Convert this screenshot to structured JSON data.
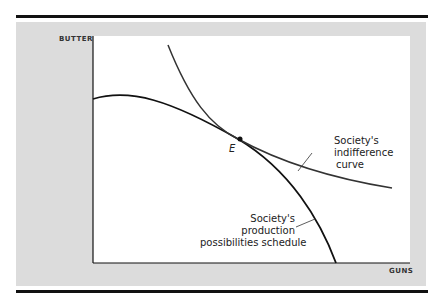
{
  "axes": {
    "y_label": "BUTTER",
    "x_label": "GUNS"
  },
  "curves": {
    "indifference": {
      "label_lines": [
        "Society's",
        "indifference",
        "curve"
      ]
    },
    "ppf": {
      "label_lines": [
        "Society's",
        "production",
        "possibilities schedule"
      ]
    }
  },
  "point": {
    "label": "E"
  },
  "colors": {
    "panel": "#dcdcdc",
    "line": "#111111"
  }
}
